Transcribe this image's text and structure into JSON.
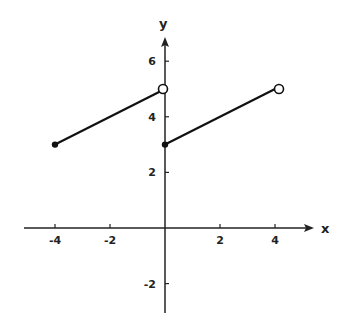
{
  "chart_data": {
    "type": "line",
    "title": "",
    "xlabel": "x",
    "ylabel": "y",
    "xlim": [
      -5,
      5.3
    ],
    "ylim": [
      -3.3,
      7
    ],
    "grid": false,
    "x_ticks": [
      -4,
      -2,
      2,
      4
    ],
    "x_tick_labels": [
      "-4",
      "-2",
      "2",
      "4"
    ],
    "y_ticks": [
      -2,
      2,
      4,
      6
    ],
    "y_tick_labels": [
      "-2",
      "2",
      "4",
      "6"
    ],
    "series": [
      {
        "name": "segment-1",
        "points": [
          [
            -4,
            3
          ],
          [
            0,
            5
          ]
        ],
        "endpoints": [
          {
            "x": -4,
            "y": 3,
            "type": "closed"
          },
          {
            "x": 0,
            "y": 5,
            "type": "open"
          }
        ]
      },
      {
        "name": "segment-2",
        "points": [
          [
            0,
            3
          ],
          [
            4,
            5
          ]
        ],
        "endpoints": [
          {
            "x": 0,
            "y": 3,
            "type": "closed"
          },
          {
            "x": 4,
            "y": 5,
            "type": "open"
          }
        ]
      }
    ]
  }
}
